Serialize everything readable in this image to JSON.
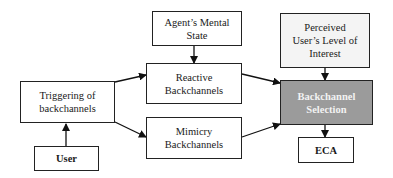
{
  "diagram": {
    "nodes": {
      "agent_mental_state": {
        "label": "Agent’s Mental State",
        "line1": "Agent’s Mental",
        "line2": "State"
      },
      "perceived_interest": {
        "label": "Perceived User’s Level of Interest",
        "line1": "Perceived",
        "line2": "User’s Level of",
        "line3": "Interest"
      },
      "triggering": {
        "label": "Triggering of backchannels",
        "line1": "Triggering of",
        "line2": "backchannels"
      },
      "reactive": {
        "label": "Reactive Backchannels",
        "line1": "Reactive",
        "line2": "Backchannels"
      },
      "mimicry": {
        "label": "Mimicry Backchannels",
        "line1": "Mimicry",
        "line2": "Backchannels"
      },
      "selection": {
        "label": "Backchannel Selection",
        "line1": "Backchannel",
        "line2": "Selection"
      },
      "user": {
        "label": "User"
      },
      "eca": {
        "label": "ECA"
      }
    },
    "edges": [
      {
        "from": "User",
        "to": "Triggering of backchannels"
      },
      {
        "from": "Triggering of backchannels",
        "to": "Reactive Backchannels"
      },
      {
        "from": "Triggering of backchannels",
        "to": "Mimicry Backchannels"
      },
      {
        "from": "Agent’s Mental State",
        "to": "Reactive Backchannels"
      },
      {
        "from": "Reactive Backchannels",
        "to": "Backchannel Selection"
      },
      {
        "from": "Mimicry Backchannels",
        "to": "Backchannel Selection"
      },
      {
        "from": "Perceived User’s Level of Interest",
        "to": "Backchannel Selection"
      },
      {
        "from": "Backchannel Selection",
        "to": "ECA"
      }
    ],
    "colors": {
      "selection_fill": "#9b9b9b",
      "border": "#222222",
      "light_fill": "#f4f4f4"
    }
  }
}
